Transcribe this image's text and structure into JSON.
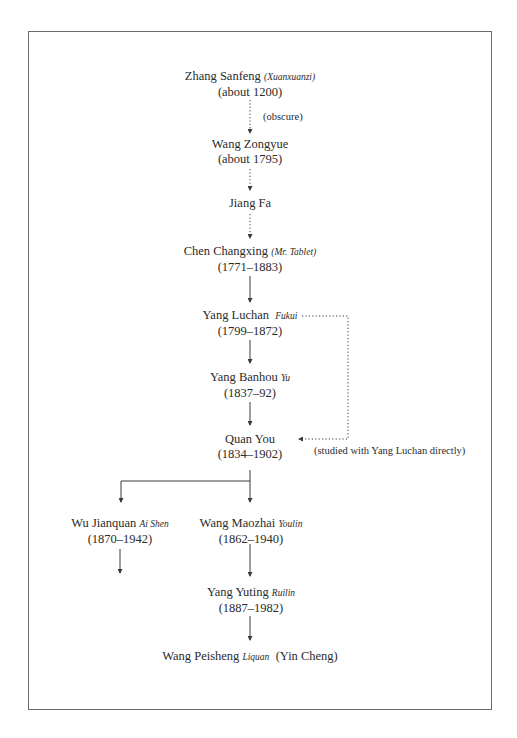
{
  "diagram": {
    "type": "lineage-tree",
    "nodes": [
      {
        "id": "zhang_sanfeng",
        "name": "Zhang Sanfeng",
        "alt_name": "(Xuanxuanzi)",
        "dates": "(about 1200)"
      },
      {
        "id": "wang_zongyue",
        "name": "Wang Zongyue",
        "alt_name": "",
        "dates": "(about 1795)"
      },
      {
        "id": "jiang_fa",
        "name": "Jiang Fa",
        "alt_name": "",
        "dates": ""
      },
      {
        "id": "chen_changxing",
        "name": "Chen Changxing",
        "alt_name": "(Mr. Tablet)",
        "dates": "(1771–1883)"
      },
      {
        "id": "yang_luchan",
        "name": "Yang Luchan",
        "alt_name": "Fukui",
        "dates": "(1799–1872)"
      },
      {
        "id": "yang_banhou",
        "name": "Yang Banhou",
        "alt_name": "Yu",
        "dates": "(1837–92)"
      },
      {
        "id": "quan_you",
        "name": "Quan You",
        "alt_name": "",
        "dates": "(1834–1902)"
      },
      {
        "id": "wu_jianquan",
        "name": "Wu Jianquan",
        "alt_name": "Ai Shen",
        "dates": "(1870–1942)"
      },
      {
        "id": "wang_maozhai",
        "name": "Wang Maozhai",
        "alt_name": "Youlin",
        "dates": "(1862–1940)"
      },
      {
        "id": "yang_yuting",
        "name": "Yang Yuting",
        "alt_name": "Ruilin",
        "dates": "(1887–1982)"
      },
      {
        "id": "wang_peisheng",
        "name": "Wang Peisheng",
        "alt_name": "Liquan",
        "suffix": "(Yin Cheng)",
        "dates": ""
      }
    ],
    "edges": [
      {
        "from": "zhang_sanfeng",
        "to": "wang_zongyue",
        "style": "dotted"
      },
      {
        "from": "wang_zongyue",
        "to": "jiang_fa",
        "style": "dotted"
      },
      {
        "from": "jiang_fa",
        "to": "chen_changxing",
        "style": "dotted"
      },
      {
        "from": "chen_changxing",
        "to": "yang_luchan",
        "style": "solid"
      },
      {
        "from": "yang_luchan",
        "to": "yang_banhou",
        "style": "solid"
      },
      {
        "from": "yang_banhou",
        "to": "quan_you",
        "style": "solid"
      },
      {
        "from": "yang_luchan",
        "to": "quan_you",
        "style": "dotted"
      },
      {
        "from": "quan_you",
        "to": "wu_jianquan",
        "style": "solid"
      },
      {
        "from": "quan_you",
        "to": "wang_maozhai",
        "style": "solid"
      },
      {
        "from": "wang_maozhai",
        "to": "yang_yuting",
        "style": "solid"
      },
      {
        "from": "yang_yuting",
        "to": "wang_peisheng",
        "style": "solid"
      }
    ],
    "notes": {
      "obscure": "(obscure)",
      "direct_study": "(studied with Yang Luchan directly)"
    },
    "colors": {
      "line": "#3a3a3a",
      "frame": "#6b6b6b",
      "text": "#2b2b2b"
    }
  }
}
